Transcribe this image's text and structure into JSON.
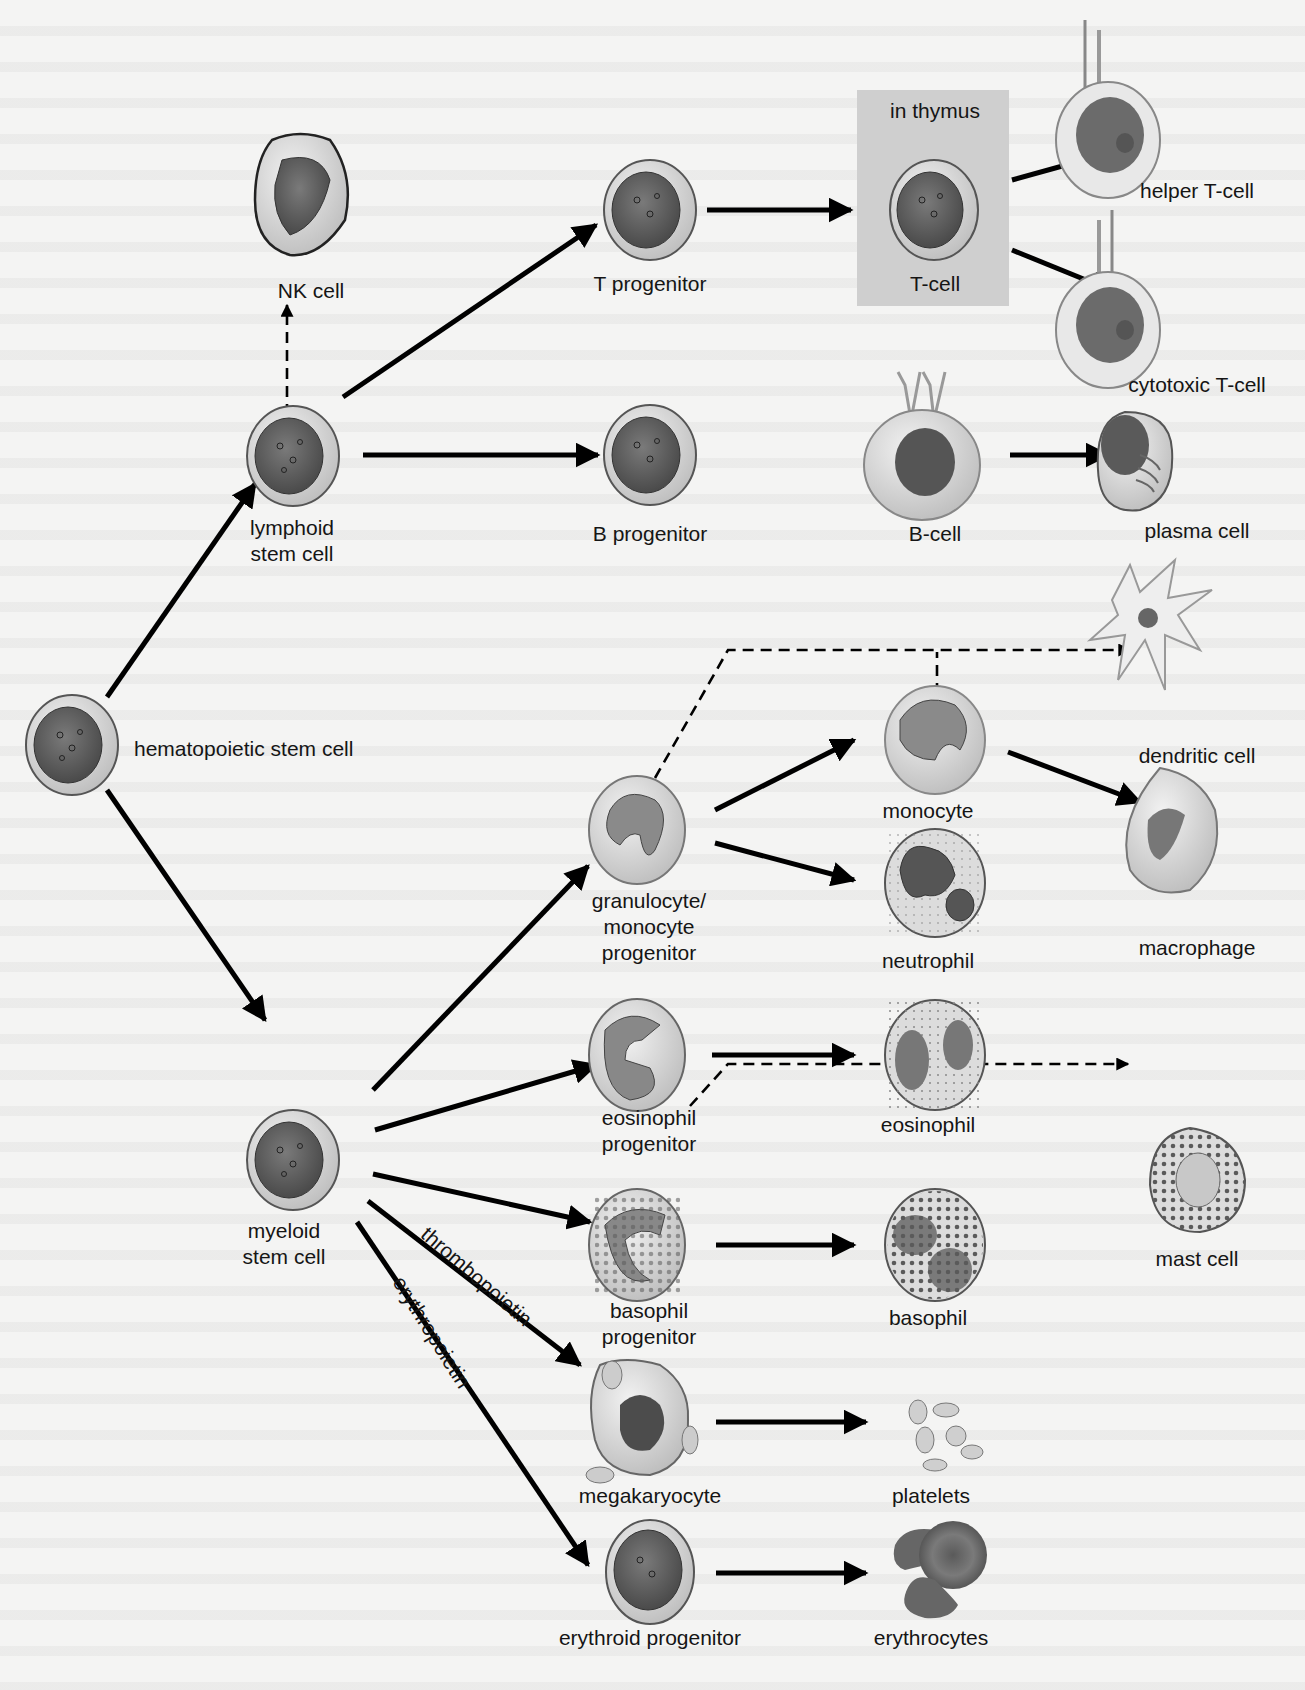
{
  "figure": {
    "region_box": {
      "label": "in thymus"
    },
    "cells": {
      "hsc": "hematopoietic stem cell",
      "lymphoid_line1": "lymphoid",
      "lymphoid_line2": "stem cell",
      "myeloid_line1": "myeloid",
      "myeloid_line2": "stem cell",
      "nk": "NK cell",
      "t_progenitor": "T progenitor",
      "t_cell": "T-cell",
      "helper_t": "helper T-cell",
      "cytotoxic_t": "cytotoxic T-cell",
      "b_progenitor": "B progenitor",
      "b_cell": "B-cell",
      "plasma": "plasma cell",
      "gm_line1": "granulocyte/",
      "gm_line2": "monocyte",
      "gm_line3": "progenitor",
      "monocyte": "monocyte",
      "neutrophil": "neutrophil",
      "dendritic": "dendritic cell",
      "macrophage": "macrophage",
      "eos_prog_line1": "eosinophil",
      "eos_prog_line2": "progenitor",
      "eosinophil": "eosinophil",
      "baso_prog_line1": "basophil",
      "baso_prog_line2": "progenitor",
      "basophil": "basophil",
      "mast": "mast cell",
      "megakaryocyte": "megakaryocyte",
      "platelets": "platelets",
      "erythroid_progenitor": "erythroid progenitor",
      "erythrocytes": "erythrocytes"
    },
    "arrow_labels": {
      "thrombopoietin": "thrombopoietin",
      "erythropoietin": "erythropoietin"
    },
    "edges": [
      {
        "from": "hematopoietic stem cell",
        "to": "lymphoid stem cell",
        "style": "solid"
      },
      {
        "from": "hematopoietic stem cell",
        "to": "myeloid stem cell",
        "style": "solid"
      },
      {
        "from": "lymphoid stem cell",
        "to": "NK cell",
        "style": "dashed"
      },
      {
        "from": "lymphoid stem cell",
        "to": "T progenitor",
        "style": "solid"
      },
      {
        "from": "lymphoid stem cell",
        "to": "B progenitor",
        "style": "solid"
      },
      {
        "from": "T progenitor",
        "to": "T-cell",
        "style": "solid"
      },
      {
        "from": "T-cell",
        "to": "helper T-cell",
        "style": "solid"
      },
      {
        "from": "T-cell",
        "to": "cytotoxic T-cell",
        "style": "solid"
      },
      {
        "from": "B progenitor",
        "to": "B-cell",
        "style": "solid"
      },
      {
        "from": "B-cell",
        "to": "plasma cell",
        "style": "solid"
      },
      {
        "from": "myeloid stem cell",
        "to": "granulocyte/monocyte progenitor",
        "style": "solid"
      },
      {
        "from": "myeloid stem cell",
        "to": "eosinophil progenitor",
        "style": "solid"
      },
      {
        "from": "myeloid stem cell",
        "to": "basophil progenitor",
        "style": "solid"
      },
      {
        "from": "myeloid stem cell",
        "to": "megakaryocyte",
        "style": "solid",
        "label": "thrombopoietin"
      },
      {
        "from": "myeloid stem cell",
        "to": "erythroid progenitor",
        "style": "solid",
        "label": "erythropoietin"
      },
      {
        "from": "granulocyte/monocyte progenitor",
        "to": "monocyte",
        "style": "solid"
      },
      {
        "from": "granulocyte/monocyte progenitor",
        "to": "neutrophil",
        "style": "solid"
      },
      {
        "from": "granulocyte/monocyte progenitor",
        "to": "dendritic cell",
        "style": "dashed"
      },
      {
        "from": "monocyte",
        "to": "dendritic cell",
        "style": "dashed"
      },
      {
        "from": "monocyte",
        "to": "macrophage",
        "style": "solid"
      },
      {
        "from": "eosinophil progenitor",
        "to": "eosinophil",
        "style": "solid"
      },
      {
        "from": "basophil progenitor",
        "to": "basophil",
        "style": "solid"
      },
      {
        "from": "basophil progenitor",
        "to": "mast cell",
        "style": "dashed"
      },
      {
        "from": "megakaryocyte",
        "to": "platelets",
        "style": "solid"
      },
      {
        "from": "erythroid progenitor",
        "to": "erythrocytes",
        "style": "solid"
      }
    ]
  }
}
